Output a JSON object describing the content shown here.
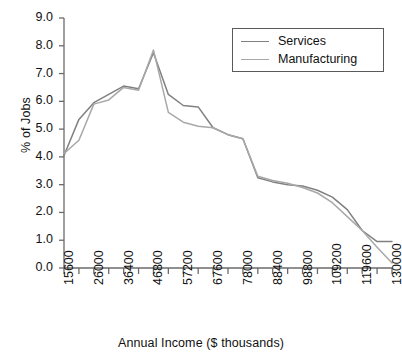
{
  "chart_data": {
    "type": "line",
    "title": "",
    "xlabel": "Annual Income ($ thousands)",
    "ylabel": "% of Jobs",
    "grid": false,
    "legend_position": "top-right",
    "ylim": [
      0.0,
      9.0
    ],
    "ytick_labels": [
      "0.0",
      "1.0",
      "2.0",
      "3.0",
      "4.0",
      "5.0",
      "6.0",
      "7.0",
      "8.0",
      "9.0"
    ],
    "ytick_values": [
      0.0,
      1.0,
      2.0,
      3.0,
      4.0,
      5.0,
      6.0,
      7.0,
      8.0,
      9.0
    ],
    "xtick_labels": [
      "15600",
      "26000",
      "36400",
      "46800",
      "57200",
      "67600",
      "78000",
      "88400",
      "98800",
      "109200",
      "119600",
      "130000"
    ],
    "xtick_values": [
      15600,
      26000,
      36400,
      46800,
      57200,
      67600,
      78000,
      88400,
      98800,
      109200,
      119600,
      130000
    ],
    "x_minor_ticks_between": 1,
    "x": [
      15600,
      20800,
      26000,
      31200,
      36400,
      41600,
      46800,
      52000,
      57200,
      62400,
      67600,
      72800,
      78000,
      83200,
      88400,
      93600,
      98800,
      104000,
      109200,
      114400,
      119600,
      124800,
      130000
    ],
    "series": [
      {
        "name": "Services",
        "color": "#808080",
        "values": [
          4.05,
          5.35,
          5.95,
          6.25,
          6.55,
          6.45,
          7.75,
          6.25,
          5.85,
          5.8,
          5.05,
          4.8,
          4.65,
          3.25,
          3.1,
          3.0,
          2.95,
          2.8,
          2.55,
          2.1,
          1.35,
          0.95,
          0.95
        ]
      },
      {
        "name": "Manufacturing",
        "color": "#a8a8a8",
        "values": [
          4.12,
          4.6,
          5.9,
          6.05,
          6.5,
          6.4,
          7.85,
          5.6,
          5.25,
          5.1,
          5.05,
          4.8,
          4.65,
          3.3,
          3.15,
          3.05,
          2.9,
          2.7,
          2.35,
          1.85,
          1.35,
          0.75,
          0.18
        ]
      }
    ]
  },
  "legend": {
    "entries": [
      {
        "label": "Services"
      },
      {
        "label": "Manufacturing"
      }
    ]
  }
}
